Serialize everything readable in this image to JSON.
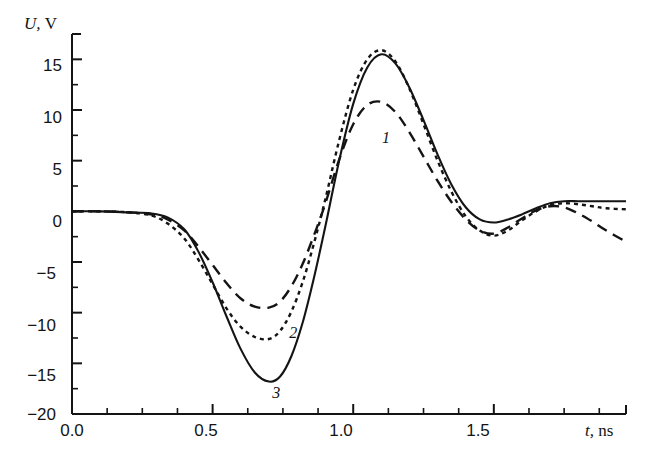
{
  "figure": {
    "background_color": "#ffffff",
    "ink_color": "#141414"
  },
  "axes": {
    "y_axis_label": "U,",
    "y_axis_unit": "V",
    "x_axis_label": "t,",
    "x_axis_unit": "ns",
    "y_ticks": [
      "15",
      "10",
      "5",
      "0",
      "−5",
      "−10",
      "−15",
      "−20"
    ],
    "x_ticks": [
      "0.0",
      "0.5",
      "1.0",
      "1.5"
    ]
  },
  "curve_labels": {
    "one": "1",
    "two": "2",
    "three": "3"
  },
  "chart_data": {
    "type": "line",
    "title": "",
    "xlabel": "t, ns",
    "ylabel": "U, V",
    "xlim": [
      0.0,
      1.97
    ],
    "ylim": [
      -20,
      17.5
    ],
    "grid": false,
    "legend": "inline curve numbers 1, 2, 3",
    "x_tick_values": [
      0.0,
      0.5,
      1.0,
      1.5
    ],
    "x_minor_tick_step": 0.125,
    "y_tick_values": [
      15,
      10,
      5,
      0,
      -5,
      -10,
      -15,
      -20
    ],
    "y_minor_tick_step": 2.5,
    "series": [
      {
        "name": "1",
        "style": "dashed",
        "label_position": {
          "t": 1.12,
          "U": 7.0
        },
        "x": [
          0.0,
          0.1,
          0.2,
          0.28,
          0.34,
          0.4,
          0.45,
          0.5,
          0.55,
          0.6,
          0.65,
          0.7,
          0.74,
          0.78,
          0.82,
          0.86,
          0.9,
          0.95,
          1.0,
          1.05,
          1.1,
          1.15,
          1.2,
          1.25,
          1.3,
          1.35,
          1.4,
          1.45,
          1.5,
          1.55,
          1.6,
          1.65,
          1.7,
          1.75,
          1.8,
          1.85,
          1.9,
          1.97
        ],
        "y": [
          0.0,
          0.0,
          -0.1,
          -0.3,
          -0.8,
          -1.9,
          -3.5,
          -5.3,
          -7.1,
          -8.6,
          -9.4,
          -9.5,
          -8.9,
          -7.4,
          -5.2,
          -2.4,
          0.7,
          5.1,
          8.6,
          10.5,
          10.8,
          9.8,
          7.8,
          5.4,
          3.0,
          0.9,
          -0.8,
          -1.9,
          -2.2,
          -1.6,
          -0.7,
          0.1,
          0.5,
          0.4,
          -0.2,
          -1.0,
          -1.9,
          -3.0
        ]
      },
      {
        "name": "2",
        "style": "dotted",
        "label_position": {
          "t": 0.79,
          "U": -12.2
        },
        "x": [
          0.0,
          0.1,
          0.2,
          0.28,
          0.34,
          0.4,
          0.45,
          0.5,
          0.55,
          0.6,
          0.65,
          0.7,
          0.74,
          0.78,
          0.82,
          0.86,
          0.9,
          0.95,
          1.0,
          1.05,
          1.1,
          1.15,
          1.2,
          1.25,
          1.3,
          1.35,
          1.4,
          1.45,
          1.5,
          1.55,
          1.6,
          1.65,
          1.7,
          1.75,
          1.8,
          1.85,
          1.9,
          1.97
        ],
        "y": [
          0.0,
          0.0,
          -0.1,
          -0.4,
          -1.2,
          -2.7,
          -4.8,
          -7.2,
          -9.6,
          -11.4,
          -12.4,
          -12.6,
          -11.8,
          -9.9,
          -7.0,
          -3.2,
          1.1,
          7.0,
          12.0,
          15.0,
          15.9,
          14.8,
          12.1,
          8.6,
          5.0,
          1.9,
          -0.5,
          -1.9,
          -2.4,
          -1.9,
          -0.9,
          0.0,
          0.6,
          0.8,
          0.7,
          0.5,
          0.3,
          0.2
        ]
      },
      {
        "name": "3",
        "style": "solid",
        "label_position": {
          "t": 0.73,
          "U": -18.1
        },
        "x": [
          0.0,
          0.1,
          0.2,
          0.28,
          0.34,
          0.4,
          0.45,
          0.5,
          0.55,
          0.6,
          0.65,
          0.7,
          0.74,
          0.78,
          0.82,
          0.86,
          0.9,
          0.95,
          1.0,
          1.05,
          1.1,
          1.15,
          1.2,
          1.25,
          1.3,
          1.35,
          1.4,
          1.45,
          1.5,
          1.55,
          1.6,
          1.65,
          1.7,
          1.75,
          1.8,
          1.85,
          1.9,
          1.97
        ],
        "y": [
          0.0,
          0.0,
          -0.1,
          -0.2,
          -0.6,
          -1.8,
          -4.0,
          -7.0,
          -10.4,
          -13.6,
          -15.9,
          -16.8,
          -16.3,
          -14.3,
          -11.0,
          -6.6,
          -1.6,
          5.0,
          10.6,
          14.2,
          15.5,
          14.6,
          12.2,
          9.0,
          5.6,
          2.6,
          0.4,
          -0.8,
          -1.1,
          -0.8,
          -0.3,
          0.3,
          0.8,
          1.0,
          1.0,
          1.0,
          1.0,
          1.0
        ]
      }
    ]
  }
}
